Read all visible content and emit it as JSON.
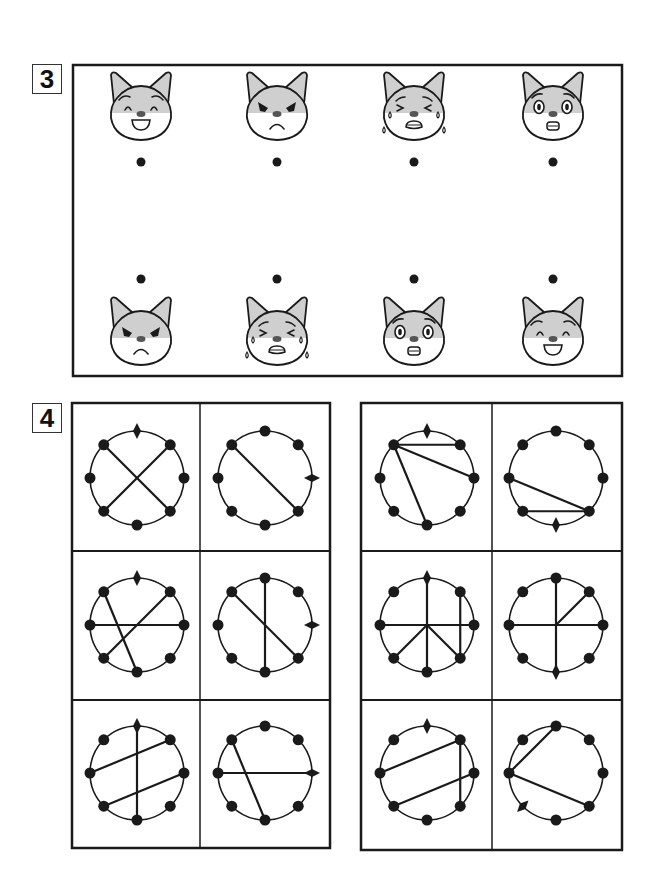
{
  "sections": [
    {
      "number": "3",
      "label_box": {
        "x": 32,
        "y": 64
      },
      "frame": {
        "x": 73,
        "y": 65,
        "w": 549,
        "h": 311
      },
      "top_row": {
        "face_y": 108,
        "dot_y": 162,
        "items": [
          {
            "x": 141,
            "expression": "happy"
          },
          {
            "x": 277,
            "expression": "angry"
          },
          {
            "x": 414,
            "expression": "crying"
          },
          {
            "x": 553,
            "expression": "surprised"
          }
        ]
      },
      "bottom_row": {
        "face_y": 333,
        "dot_y": 279,
        "items": [
          {
            "x": 141,
            "expression": "angry"
          },
          {
            "x": 277,
            "expression": "crying"
          },
          {
            "x": 414,
            "expression": "surprised"
          },
          {
            "x": 553,
            "expression": "happy"
          }
        ]
      }
    },
    {
      "number": "4",
      "label_box": {
        "x": 32,
        "y": 403
      },
      "grids": [
        {
          "name": "left-grid",
          "x": 72,
          "y": 403,
          "w": 258,
          "h": 445,
          "col_split": 200,
          "row_splits": [
            551,
            700
          ],
          "cells": [
            {
              "cx": 137,
              "cy": 478,
              "diamond": "N",
              "lines": [
                [
                  "NW",
                  "SE"
                ],
                [
                  "NE",
                  "SW"
                ]
              ]
            },
            {
              "cx": 265,
              "cy": 478,
              "diamond": "E",
              "lines": [
                [
                  "NW",
                  "SE"
                ]
              ]
            },
            {
              "cx": 137,
              "cy": 625,
              "diamond": "N",
              "lines": [
                [
                  "W",
                  "E"
                ],
                [
                  "NE",
                  "SW"
                ],
                [
                  "NW",
                  "S"
                ]
              ]
            },
            {
              "cx": 265,
              "cy": 625,
              "diamond": "E",
              "lines": [
                [
                  "N",
                  "S"
                ],
                [
                  "NW",
                  "SE"
                ]
              ]
            },
            {
              "cx": 137,
              "cy": 773,
              "diamond": "N",
              "lines": [
                [
                  "N",
                  "S"
                ],
                [
                  "W",
                  "NE"
                ],
                [
                  "SW",
                  "E"
                ]
              ]
            },
            {
              "cx": 265,
              "cy": 773,
              "diamond": "E",
              "lines": [
                [
                  "W",
                  "E"
                ],
                [
                  "NW",
                  "S"
                ]
              ]
            }
          ]
        },
        {
          "name": "right-grid",
          "x": 361,
          "y": 403,
          "w": 261,
          "h": 447,
          "col_split": 492,
          "row_splits": [
            551,
            700
          ],
          "cells": [
            {
              "cx": 427,
              "cy": 478,
              "diamond": "N",
              "lines": [
                [
                  "NW",
                  "NE"
                ],
                [
                  "NW",
                  "E"
                ],
                [
                  "NW",
                  "S"
                ]
              ]
            },
            {
              "cx": 556,
              "cy": 478,
              "diamond": "S",
              "lines": [
                [
                  "W",
                  "SE"
                ],
                [
                  "SW",
                  "SE"
                ]
              ]
            },
            {
              "cx": 427,
              "cy": 625,
              "diamond": "N",
              "lines": [
                [
                  "N",
                  "S"
                ],
                [
                  "W",
                  "E"
                ],
                [
                  "C",
                  "SW"
                ],
                [
                  "C",
                  "SE"
                ],
                [
                  "NE",
                  "SE"
                ]
              ]
            },
            {
              "cx": 556,
              "cy": 625,
              "diamond": "S",
              "lines": [
                [
                  "N",
                  "S"
                ],
                [
                  "W",
                  "E"
                ],
                [
                  "C",
                  "NE"
                ]
              ]
            },
            {
              "cx": 427,
              "cy": 773,
              "diamond": "N",
              "lines": [
                [
                  "W",
                  "NE"
                ],
                [
                  "NE",
                  "SE"
                ],
                [
                  "SW",
                  "E"
                ]
              ]
            },
            {
              "cx": 556,
              "cy": 773,
              "diamond": "SW",
              "lines": [
                [
                  "N",
                  "W"
                ],
                [
                  "W",
                  "SE"
                ]
              ]
            }
          ]
        }
      ]
    }
  ],
  "style": {
    "ink": "#1a1a1a",
    "fur_gray": "#cfcfcf",
    "nose_gray": "#555555",
    "circle_radius": 47,
    "dot_radius": 5.5
  }
}
